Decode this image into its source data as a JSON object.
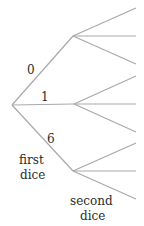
{
  "diagram": {
    "type": "tree-diagram",
    "edge_color": "#a9a9a9",
    "text_color": "#2b2b2b",
    "first_level_branch_labels": [
      "0",
      "1",
      "6"
    ],
    "first_level_caption_line1": "first",
    "first_level_caption_line2": "dice",
    "second_level_caption_line1": "second",
    "second_level_caption_line2": "dice",
    "nodes": {
      "root": [
        12,
        105
      ],
      "branch_0": [
        73,
        36
      ],
      "branch_1": [
        74,
        104
      ],
      "branch_6": [
        73,
        171
      ]
    },
    "leaf_x": 136,
    "leaves_per_branch": 3
  }
}
